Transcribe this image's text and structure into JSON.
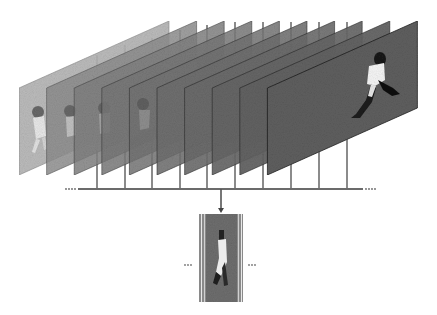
{
  "diagram": {
    "title": "",
    "frames": {
      "count": 10,
      "first_left_x": 19,
      "spacing_x": 27.6,
      "width": 150,
      "top_rise": 67,
      "height": 87,
      "top_y": 88,
      "fill_dark": "#5a5a5a",
      "fill_light": "#a8a8a8",
      "stroke": "#333333"
    },
    "timeline": {
      "y": 189,
      "x_start": 78,
      "x_end": 363,
      "ellipsis_left": "···",
      "ellipsis_right": "···",
      "color": "#6b6b6b"
    },
    "output": {
      "arrow_x": 221,
      "arrow_from_y": 189,
      "arrow_to_y": 212,
      "ellipsis_left": "···",
      "ellipsis_right": "···",
      "strip_count": 5
    },
    "colors": {
      "line": "#6e6e6e",
      "background": "#ffffff"
    }
  }
}
